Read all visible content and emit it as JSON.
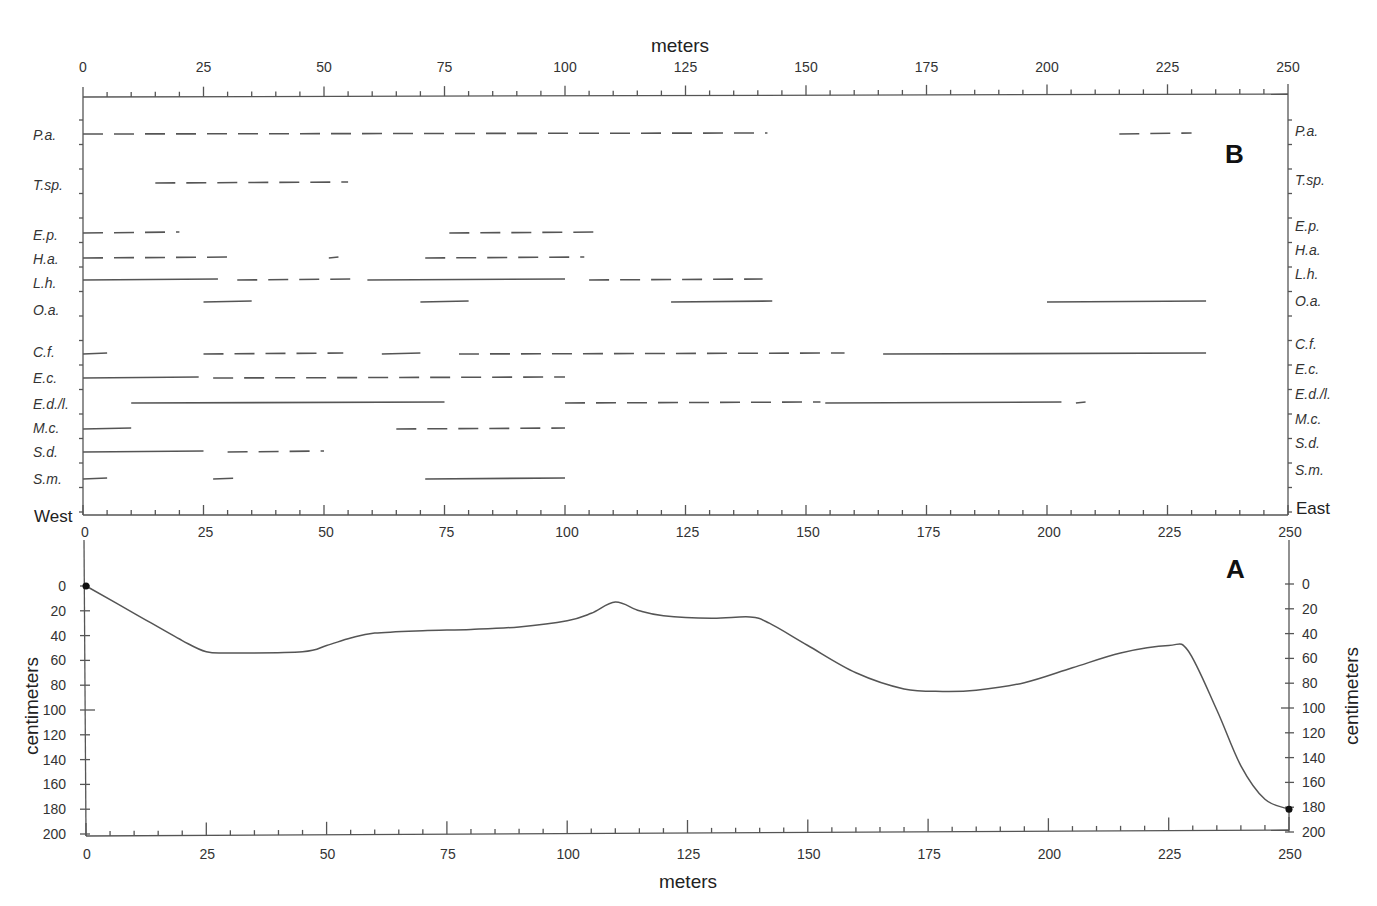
{
  "chart_data": [
    {
      "panel": "B",
      "type": "range-bar",
      "title": "",
      "xlabel": "meters",
      "xlim": [
        0,
        250
      ],
      "xticks": [
        0,
        25,
        50,
        75,
        100,
        125,
        150,
        175,
        200,
        225,
        250
      ],
      "left_end_label": "West",
      "right_end_label": "East",
      "species": [
        {
          "label": "P.a.",
          "segments": [
            [
              0,
              142
            ],
            [
              215,
              230
            ]
          ],
          "style": "dashed"
        },
        {
          "label": "T.sp.",
          "segments": [
            [
              15,
              55
            ]
          ],
          "style": "dashed"
        },
        {
          "label": "E.p.",
          "segments": [
            [
              0,
              20
            ],
            [
              76,
              108
            ]
          ],
          "style": "dashed"
        },
        {
          "label": "H.a.",
          "segments": [
            [
              0,
              32
            ],
            [
              51,
              53
            ],
            [
              71,
              104
            ]
          ],
          "style": "dashed"
        },
        {
          "label": "L.h.",
          "segments": [
            [
              0,
              28
            ],
            [
              32,
              56
            ],
            [
              59,
              100
            ],
            [
              105,
              141
            ]
          ],
          "style": "mixed"
        },
        {
          "label": "O.a.",
          "segments": [
            [
              25,
              35
            ],
            [
              70,
              80
            ],
            [
              122,
              143
            ],
            [
              200,
              233
            ]
          ],
          "style": "solid"
        },
        {
          "label": "C.f.",
          "segments": [
            [
              0,
              5
            ],
            [
              25,
              54
            ],
            [
              62,
              70
            ],
            [
              78,
              158
            ],
            [
              166,
              233
            ]
          ],
          "style": "mixed"
        },
        {
          "label": "E.c.",
          "segments": [
            [
              0,
              24
            ],
            [
              27,
              100
            ]
          ],
          "style": "mixed"
        },
        {
          "label": "E.d./l.",
          "segments": [
            [
              10,
              75
            ],
            [
              100,
              153
            ],
            [
              154,
              203
            ],
            [
              206,
              208
            ]
          ],
          "style": "mixed"
        },
        {
          "label": "M.c.",
          "segments": [
            [
              0,
              10
            ],
            [
              65,
              100
            ]
          ],
          "style": "mixed"
        },
        {
          "label": "S.d.",
          "segments": [
            [
              0,
              25
            ],
            [
              30,
              50
            ]
          ],
          "style": "mixed"
        },
        {
          "label": "S.m.",
          "segments": [
            [
              0,
              5
            ],
            [
              27,
              33
            ],
            [
              71,
              100
            ]
          ],
          "style": "mixed"
        }
      ]
    },
    {
      "panel": "A",
      "type": "line",
      "title": "",
      "xlabel": "meters",
      "ylabel": "centimeters",
      "xlim": [
        0,
        250
      ],
      "ylim": [
        0,
        200
      ],
      "y_inverted": true,
      "xticks": [
        0,
        25,
        50,
        75,
        100,
        125,
        150,
        175,
        200,
        225,
        250
      ],
      "yticks": [
        0,
        20,
        40,
        60,
        80,
        100,
        120,
        140,
        160,
        180,
        200
      ],
      "x": [
        0,
        10,
        20,
        25,
        30,
        45,
        50,
        55,
        60,
        70,
        80,
        90,
        100,
        105,
        110,
        115,
        120,
        130,
        138,
        142,
        150,
        160,
        170,
        178,
        185,
        195,
        205,
        215,
        225,
        229,
        235,
        240,
        245,
        250
      ],
      "values": [
        0,
        22,
        44,
        53,
        54,
        53,
        48,
        42,
        38,
        36,
        35,
        33,
        28,
        22,
        13,
        20,
        24,
        26,
        25,
        30,
        48,
        70,
        83,
        85,
        84,
        78,
        66,
        54,
        48,
        52,
        100,
        145,
        172,
        180
      ]
    }
  ],
  "labels": {
    "top_axis_title": "meters",
    "bottom_axis_title": "meters",
    "left_y_title": "centimeters",
    "right_y_title": "centimeters",
    "panel_b": "B",
    "panel_a": "A",
    "west": "West",
    "east": "East"
  }
}
